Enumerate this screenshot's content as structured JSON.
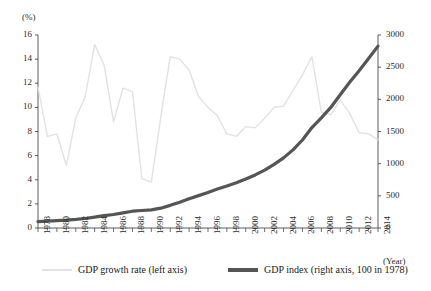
{
  "chart_data": {
    "type": "line",
    "title": "",
    "xlabel": "(Year)",
    "ylabel_left": "(%)",
    "ylabel_right": "",
    "x": [
      1978,
      1979,
      1980,
      1981,
      1982,
      1983,
      1984,
      1985,
      1986,
      1987,
      1988,
      1989,
      1990,
      1991,
      1992,
      1993,
      1994,
      1995,
      1996,
      1997,
      1998,
      1999,
      2000,
      2001,
      2002,
      2003,
      2004,
      2005,
      2006,
      2007,
      2008,
      2009,
      2010,
      2011,
      2012,
      2013,
      2014
    ],
    "xlim": [
      1978,
      2014
    ],
    "xticks": [
      1978,
      1980,
      1982,
      1984,
      1986,
      1988,
      1990,
      1992,
      1994,
      1996,
      1998,
      2000,
      2002,
      2004,
      2006,
      2008,
      2010,
      2012,
      2014
    ],
    "xtick_labels": [
      "1978",
      "1980",
      "1982",
      "1984",
      "1986",
      "1988",
      "1990",
      "1992",
      "1994",
      "1996",
      "1998",
      "2000",
      "2002",
      "2004",
      "2006",
      "2008",
      "2010",
      "2012",
      "2014"
    ],
    "ylim_left": [
      0,
      16
    ],
    "yticks_left": [
      0,
      2,
      4,
      6,
      8,
      10,
      12,
      14,
      16
    ],
    "ytick_labels_left": [
      "0",
      "2",
      "4",
      "6",
      "8",
      "10",
      "12",
      "14",
      "16"
    ],
    "ylim_right": [
      0,
      3000
    ],
    "yticks_right": [
      0,
      500,
      1000,
      1500,
      2000,
      2500,
      3000
    ],
    "ytick_labels_right": [
      "0",
      "500",
      "1000",
      "1500",
      "2000",
      "2500",
      "3000"
    ],
    "grid": false,
    "legend_position": "bottom",
    "series": [
      {
        "name": "GDP growth rate (left axis)",
        "axis": "left",
        "color": "#e2e2e2",
        "width": 1.4,
        "values": [
          11.7,
          7.6,
          7.8,
          5.2,
          9.1,
          10.9,
          15.2,
          13.5,
          8.8,
          11.6,
          11.3,
          4.1,
          3.8,
          9.2,
          14.2,
          14.0,
          13.1,
          10.9,
          10.0,
          9.3,
          7.8,
          7.6,
          8.4,
          8.3,
          9.1,
          10.0,
          10.1,
          11.4,
          12.7,
          14.2,
          9.6,
          9.4,
          10.6,
          9.5,
          7.9,
          7.8,
          7.3
        ]
      },
      {
        "name": "GDP index (right axis, 100 in 1978)",
        "axis": "right",
        "color": "#555555",
        "width": 3.2,
        "values": [
          100,
          108,
          116,
          122,
          133,
          148,
          170,
          193,
          210,
          234,
          261,
          272,
          282,
          308,
          352,
          401,
          454,
          503,
          553,
          605,
          652,
          702,
          761,
          825,
          900,
          990,
          1090,
          1214,
          1368,
          1562,
          1713,
          1874,
          2072,
          2266,
          2445,
          2634,
          2827
        ]
      }
    ]
  },
  "axes": {
    "left_unit": "(%)",
    "x_unit": "(Year)"
  },
  "legend": {
    "items": [
      {
        "label": "GDP growth rate (left axis)",
        "color": "#e2e2e2"
      },
      {
        "label": "GDP index (right axis, 100 in 1978)",
        "color": "#555555"
      }
    ]
  }
}
